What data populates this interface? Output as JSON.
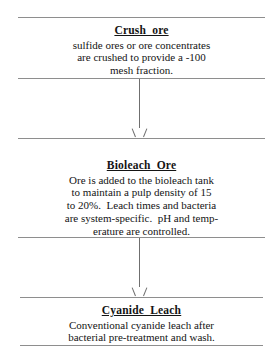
{
  "diagram": {
    "type": "process-flowchart",
    "orientation": "vertical",
    "background_color": "#ffffff",
    "rule_color": "#8e8e8e",
    "arrow_color": "#6f6f6f",
    "text_color": "#141414"
  },
  "stages": [
    {
      "id": "crush-ore",
      "title": "Crush  ore",
      "body_lines": [
        "sulfide ores or ore concentrates",
        "are crushed to provide a -100",
        "mesh fraction."
      ]
    },
    {
      "id": "bioleach-ore",
      "title": "Bioleach  Ore",
      "body_lines": [
        "Ore is added to the bioleach tank",
        "to maintain a pulp density of 15",
        "to 20%.  Leach times and bacteria",
        "are system-specific.  pH and temp-",
        "erature are controlled."
      ]
    },
    {
      "id": "cyanide-leach",
      "title": "Cyanide  Leach",
      "body_lines": [
        "Conventional cyanide leach after",
        "bacterial pre-treatment and wash."
      ]
    }
  ],
  "connectors": [
    {
      "id": "crush-to-bioleach",
      "from": "crush-ore",
      "to": "bioleach-ore"
    },
    {
      "id": "bioleach-to-cyanide",
      "from": "bioleach-ore",
      "to": "cyanide-leach"
    }
  ]
}
